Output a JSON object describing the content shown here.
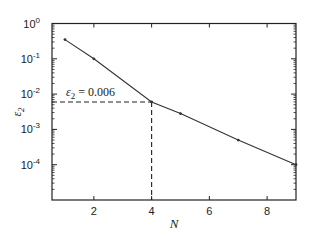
{
  "chart_data": {
    "type": "line",
    "title": "",
    "xlabel": "N",
    "ylabel": "ε2",
    "yscale": "log",
    "xlim": [
      0.55,
      9
    ],
    "ylim": [
      1e-05,
      1
    ],
    "grid": false,
    "x_ticks": [
      2,
      4,
      6,
      8
    ],
    "y_ticks": [
      {
        "base": "10",
        "exp": "0",
        "value": 1
      },
      {
        "base": "10",
        "exp": "-1",
        "value": 0.1
      },
      {
        "base": "10",
        "exp": "-2",
        "value": 0.01
      },
      {
        "base": "10",
        "exp": "-3",
        "value": 0.001
      },
      {
        "base": "10",
        "exp": "-4",
        "value": 0.0001
      }
    ],
    "series": [
      {
        "name": "ε2",
        "x": [
          1,
          2,
          4,
          5,
          7,
          9
        ],
        "values": [
          0.35,
          0.1,
          0.006,
          0.0028,
          0.0005,
          0.0001
        ]
      }
    ],
    "annotations": [
      {
        "text_var": "ε",
        "text_sub": "2",
        "text_rest": " = 0.006",
        "x": 4,
        "y": 0.006,
        "guide_lines": "dashed"
      }
    ],
    "colors": {
      "line": "#333333",
      "axis": "#222222"
    }
  }
}
